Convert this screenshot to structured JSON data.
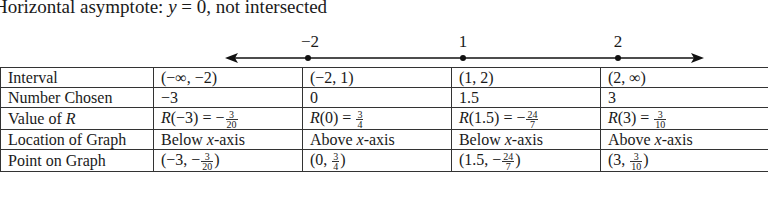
{
  "heading": {
    "prefix": "Horizontal asymptote: ",
    "var": "y",
    "suffix": " = 0, not intersected"
  },
  "number_line": {
    "points": [
      {
        "label": "−2",
        "x": 308
      },
      {
        "label": "1",
        "x": 463
      },
      {
        "label": "2",
        "x": 617
      }
    ],
    "arrow_left_x": 225,
    "arrow_right_x": 703
  },
  "table": {
    "rows": [
      {
        "header": "Interval",
        "cells": [
          "(−∞, −2)",
          "(−2, 1)",
          "(1, 2)",
          "(2, ∞)"
        ]
      },
      {
        "header": "Number Chosen",
        "cells": [
          "−3",
          "0",
          "1.5",
          "3"
        ]
      },
      {
        "header_prefix": "Value of ",
        "header_var": "R",
        "cells": [
          {
            "lhs": "(−3) = −",
            "num": "3",
            "den": "20"
          },
          {
            "lhs": "(0) = ",
            "num": "3",
            "den": "4"
          },
          {
            "lhs": "(1.5) = −",
            "num": "24",
            "den": "7"
          },
          {
            "lhs": "(3) = ",
            "num": "3",
            "den": "10"
          }
        ]
      },
      {
        "header": "Location of Graph",
        "cells": [
          {
            "word": "Below ",
            "axis": "x",
            "rest": "-axis"
          },
          {
            "word": "Above ",
            "axis": "x",
            "rest": "-axis"
          },
          {
            "word": "Below ",
            "axis": "x",
            "rest": "-axis"
          },
          {
            "word": "Above ",
            "axis": "x",
            "rest": "-axis"
          }
        ]
      },
      {
        "header": "Point on Graph",
        "cells": [
          {
            "pre": "(−3, −",
            "num": "3",
            "den": "20",
            "post": ")"
          },
          {
            "pre": "(0, ",
            "num": "3",
            "den": "4",
            "post": ")"
          },
          {
            "pre": "(1.5, −",
            "num": "24",
            "den": "7",
            "post": ")"
          },
          {
            "pre": "(3, ",
            "num": "3",
            "den": "10",
            "post": ")"
          }
        ]
      }
    ]
  }
}
